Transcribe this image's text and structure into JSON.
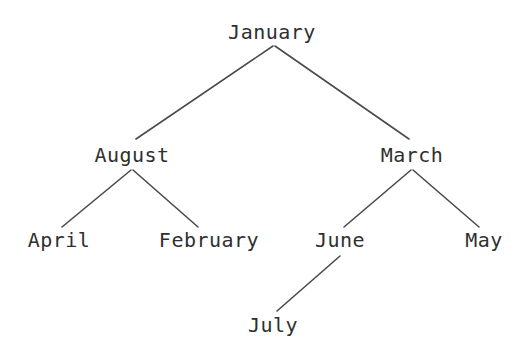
{
  "diagram": {
    "type": "binary-tree",
    "background_color": "#ffffff",
    "text_color": "#2f2f2f",
    "edge_color": "#4a4a4a",
    "width": 519,
    "height": 364,
    "nodes": [
      {
        "id": "january",
        "label": "January",
        "x": 272,
        "y": 32,
        "depth": 0
      },
      {
        "id": "august",
        "label": "August",
        "x": 132,
        "y": 155,
        "depth": 1
      },
      {
        "id": "march",
        "label": "March",
        "x": 412,
        "y": 155,
        "depth": 1
      },
      {
        "id": "april",
        "label": "April",
        "x": 59,
        "y": 240,
        "depth": 2
      },
      {
        "id": "february",
        "label": "February",
        "x": 209,
        "y": 240,
        "depth": 2
      },
      {
        "id": "june",
        "label": "June",
        "x": 340,
        "y": 240,
        "depth": 2
      },
      {
        "id": "may",
        "label": "May",
        "x": 484,
        "y": 240,
        "depth": 2
      },
      {
        "id": "july",
        "label": "July",
        "x": 273,
        "y": 325,
        "depth": 3
      }
    ],
    "edges": [
      {
        "id": "january-august",
        "from": "january",
        "to": "august",
        "side": "left",
        "x1": 273,
        "y1": 46,
        "x2": 136,
        "y2": 139
      },
      {
        "id": "january-march",
        "from": "january",
        "to": "march",
        "side": "right",
        "x1": 275,
        "y1": 46,
        "x2": 409,
        "y2": 139
      },
      {
        "id": "august-april",
        "from": "august",
        "to": "april",
        "side": "left",
        "x1": 131,
        "y1": 170,
        "x2": 62,
        "y2": 227
      },
      {
        "id": "august-february",
        "from": "august",
        "to": "february",
        "side": "right",
        "x1": 133,
        "y1": 170,
        "x2": 198,
        "y2": 227
      },
      {
        "id": "march-june",
        "from": "march",
        "to": "june",
        "side": "left",
        "x1": 411,
        "y1": 170,
        "x2": 344,
        "y2": 227
      },
      {
        "id": "march-may",
        "from": "march",
        "to": "may",
        "side": "right",
        "x1": 413,
        "y1": 170,
        "x2": 479,
        "y2": 227
      },
      {
        "id": "june-july",
        "from": "june",
        "to": "july",
        "side": "left",
        "x1": 340,
        "y1": 256,
        "x2": 277,
        "y2": 311
      }
    ]
  }
}
